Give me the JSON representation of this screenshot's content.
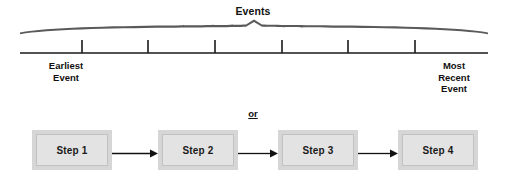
{
  "timeline": {
    "bracket_label": "Events",
    "left_label": "Earliest\nEvent",
    "left_label_line1": "Earliest",
    "left_label_line2": "Event",
    "right_label_line1": "Most",
    "right_label_line2": "Recent",
    "right_label_line3": "Event",
    "tick_count": 6,
    "tick_positions_px": [
      82,
      148,
      215,
      282,
      348,
      415
    ],
    "axis_color": "#1a1a1a",
    "brace_color": "#5a5a5a"
  },
  "separator": {
    "label": "or"
  },
  "steps": {
    "items": [
      {
        "label": "Step 1"
      },
      {
        "label": "Step 2"
      },
      {
        "label": "Step 3"
      },
      {
        "label": "Step 4"
      }
    ],
    "box_fill": "#d6d6d6",
    "box_inner_fill": "#e3e3e3",
    "arrow_color": "#111111",
    "arrow_count": 3
  },
  "colors": {
    "background": "#ffffff",
    "text": "#111111"
  }
}
